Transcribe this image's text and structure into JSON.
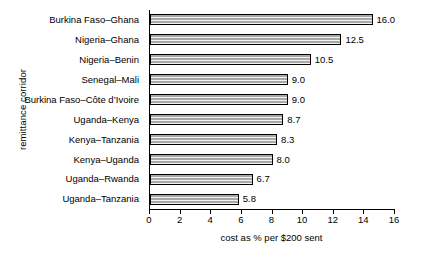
{
  "chart_data": {
    "type": "bar",
    "orientation": "horizontal",
    "title": "",
    "xlabel": "cost as % per $200 sent",
    "ylabel": "remittance corridor",
    "categories": [
      "Burkina Faso–Ghana",
      "Nigeria–Ghana",
      "Nigeria–Benin",
      "Senegal–Mali",
      "Burkina Faso–Côte d’Ivoire",
      "Uganda–Kenya",
      "Kenya–Tanzania",
      "Kenya–Uganda",
      "Uganda–Rwanda",
      "Uganda–Tanzania"
    ],
    "values": [
      16.0,
      12.5,
      10.5,
      9.0,
      9.0,
      8.7,
      8.3,
      8.0,
      6.7,
      5.8
    ],
    "value_labels": [
      "16.0",
      "12.5",
      "10.5",
      "9.0",
      "9.0",
      "8.7",
      "8.3",
      "8.0",
      "6.7",
      "5.8"
    ],
    "xlim": [
      0,
      16
    ],
    "xticks": [
      0,
      2,
      4,
      6,
      8,
      10,
      12,
      14,
      16
    ],
    "xtick_labels": [
      "0",
      "2",
      "4",
      "6",
      "8",
      "10",
      "12",
      "14",
      "16"
    ],
    "grid": false,
    "legend": null,
    "bar_color": "#a8a8a8",
    "bar_edge_color": "#000000"
  }
}
